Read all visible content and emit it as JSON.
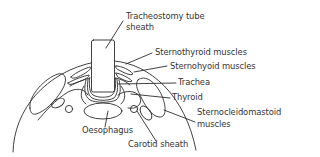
{
  "diagram": {
    "type": "anatomical cross-section",
    "colors": {
      "stroke": "#2b2b2b",
      "text": "#333333",
      "background": "#ffffff"
    },
    "labels": {
      "tube_line1": "Tracheostomy tube",
      "tube_line2": "sheath",
      "sternothyroid": "Sternothyroid muscles",
      "sternohyoid": "Sternohyoid muscles",
      "trachea": "Trachea",
      "thyroid": "Thyroid",
      "scm_line1": "Sternocleidomastoid",
      "scm_line2": "muscles",
      "oesophagus": "Oesophagus",
      "carotid": "Carotid sheath"
    }
  }
}
